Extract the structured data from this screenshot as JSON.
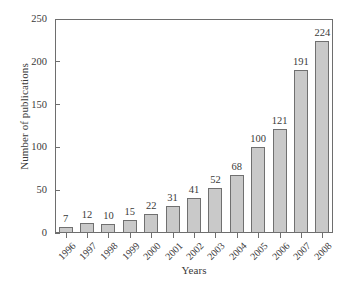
{
  "chart_data": {
    "type": "bar",
    "title": "",
    "xlabel": "Years",
    "ylabel": "Number of publications",
    "categories": [
      "1996",
      "1997",
      "1998",
      "1999",
      "2000",
      "2001",
      "2002",
      "2003",
      "2004",
      "2005",
      "2006",
      "2007",
      "2008"
    ],
    "values": [
      7,
      12,
      10,
      15,
      22,
      31,
      41,
      52,
      68,
      100,
      121,
      191,
      224
    ],
    "value_labels": [
      "7",
      "12",
      "10",
      "15",
      "22",
      "31",
      "41",
      "52",
      "68",
      "100",
      "121",
      "191",
      "224"
    ],
    "ylim": [
      0,
      250
    ],
    "yticks": [
      0,
      50,
      100,
      150,
      200,
      250
    ],
    "ytick_labels": [
      "0",
      "50",
      "100",
      "150",
      "200",
      "250"
    ],
    "grid": false,
    "legend": null,
    "bar_color": "#c9c9c9",
    "bar_border_color": "#707070",
    "axis_color": "#6e6e6e",
    "text_color": "#3a3a3a",
    "background": "#ffffff",
    "xtick_rotation_deg": 45
  }
}
